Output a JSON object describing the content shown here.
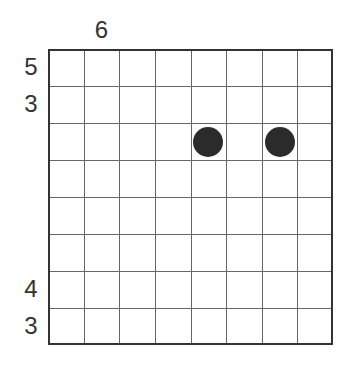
{
  "puzzle": {
    "rows": 8,
    "cols": 8,
    "column_clues": [
      {
        "col": 1,
        "value": "6"
      }
    ],
    "row_clues": [
      {
        "row": 0,
        "value": "5"
      },
      {
        "row": 1,
        "value": "3"
      },
      {
        "row": 6,
        "value": "4"
      },
      {
        "row": 7,
        "value": "3"
      }
    ],
    "stones": [
      {
        "row": 2,
        "col": 4,
        "color": "#2b2b2b"
      },
      {
        "row": 2,
        "col": 6,
        "color": "#2b2b2b"
      }
    ]
  }
}
